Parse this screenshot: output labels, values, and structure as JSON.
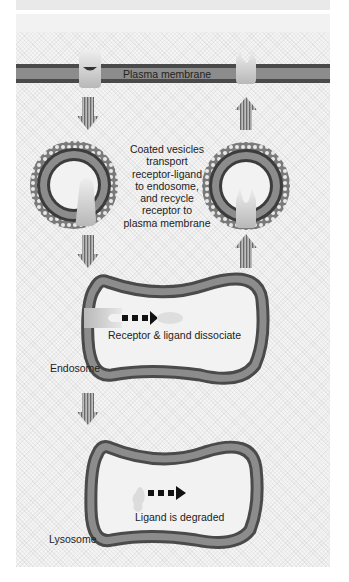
{
  "diagram": {
    "labels": {
      "plasma_membrane": "Plasma membrane",
      "coated_vesicles": [
        "Coated vesicles",
        "transport",
        "receptor-ligand",
        "to endosome,",
        "and recycle",
        "receptor to",
        "plasma membrane"
      ],
      "dissociate": "Receptor & ligand dissociate",
      "endosome": "Endosome",
      "degraded": "Ligand is degraded",
      "lysosome": "Lysosome"
    },
    "icons": [
      "down-arrow-icon",
      "up-arrow-icon",
      "receptor-ligand-icon",
      "receptor-icon",
      "coated-vesicle-icon",
      "dashed-arrow-icon"
    ],
    "colors": {
      "membrane_outer": "#4a4a4a",
      "membrane_inner": "#8c8c8c",
      "receptor": "#d6d6d6",
      "background": "#f4f4f4"
    }
  }
}
